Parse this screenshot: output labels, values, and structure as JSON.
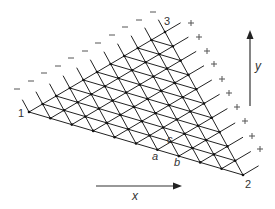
{
  "diagram": {
    "type": "triangular-lattice",
    "subdivisions": 10,
    "vertices": [
      {
        "id": "1",
        "label": "1",
        "x": 29,
        "y": 112
      },
      {
        "id": "2",
        "label": "2",
        "x": 243,
        "y": 175
      },
      {
        "id": "3",
        "label": "3",
        "x": 165,
        "y": 32
      }
    ],
    "point_labels": [
      {
        "label": "a",
        "x": 155,
        "y": 156
      },
      {
        "label": "b",
        "x": 177,
        "y": 162
      },
      {
        "label": "c",
        "x": 170,
        "y": 139
      }
    ],
    "left_edge_sign": "−",
    "right_edge_sign": "+",
    "minus_signs": [
      [
        17,
        89
      ],
      [
        31,
        81
      ],
      [
        44,
        73
      ],
      [
        58,
        66
      ],
      [
        71,
        58
      ],
      [
        85,
        51
      ],
      [
        98,
        43
      ],
      [
        112,
        35
      ],
      [
        125,
        27
      ],
      [
        139,
        20
      ],
      [
        153,
        12
      ]
    ],
    "plus_signs": [
      [
        191,
        23
      ],
      [
        199,
        37
      ],
      [
        207,
        51
      ],
      [
        214,
        64
      ],
      [
        222,
        79
      ],
      [
        229,
        93
      ],
      [
        237,
        107
      ],
      [
        245,
        121
      ],
      [
        252,
        136
      ],
      [
        260,
        149
      ]
    ],
    "axes": {
      "x": {
        "label": "x",
        "from": [
          96,
          186
        ],
        "to": [
          182,
          186
        ],
        "label_pos": [
          135,
          200
        ]
      },
      "y": {
        "label": "y",
        "from": [
          250,
          106
        ],
        "to": [
          250,
          30
        ],
        "label_pos": [
          258,
          70
        ]
      }
    },
    "line_color": "#222222",
    "sign_color": "#555555"
  }
}
